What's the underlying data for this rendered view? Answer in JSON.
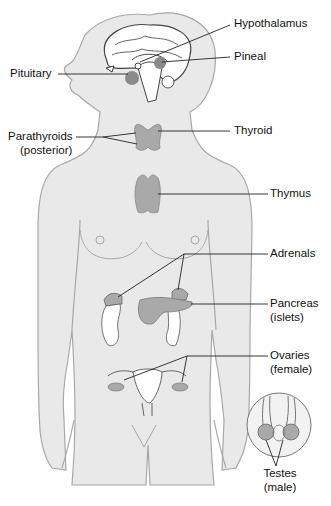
{
  "figure": {
    "type": "anatomy-diagram",
    "colors": {
      "body_fill": "#e9e9e9",
      "body_outline": "#a8a8a8",
      "gland_fill": "#a9a9a9",
      "gland_dark": "#8a8a8a",
      "leader_line": "#222222",
      "label_text": "#111111"
    }
  },
  "labels": {
    "hypothalamus": "Hypothalamus",
    "pineal": "Pineal",
    "pituitary": "Pituitary",
    "parathyroids": "Parathyroids",
    "parathyroids_sub": "(posterior)",
    "thyroid": "Thyroid",
    "thymus": "Thymus",
    "adrenals": "Adrenals",
    "pancreas": "Pancreas",
    "pancreas_sub": "(islets)",
    "ovaries": "Ovaries",
    "ovaries_sub": "(female)",
    "testes": "Testes",
    "testes_sub": "(male)"
  }
}
